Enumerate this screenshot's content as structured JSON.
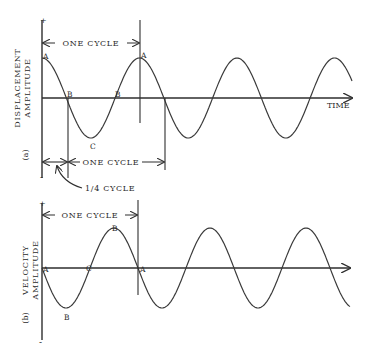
{
  "diagram": {
    "panel_a": {
      "tag": "(a)",
      "ylabel_line1": "DISPLACEMENT",
      "ylabel_line2": "AMPLITUDE",
      "plus": "+",
      "minus": "-",
      "xlabel": "TIME",
      "cycle_top": "ONE CYCLE",
      "cycle_bottom": "ONE CYCLE",
      "quarter_cycle": "1/4 CYCLE",
      "points": {
        "A1": "A",
        "A2": "A",
        "B1": "B",
        "B2": "B",
        "C": "C"
      },
      "waveform": "cosine",
      "cycles_shown": 3.2
    },
    "panel_b": {
      "tag": "(b)",
      "ylabel_line1": "VELOCITY",
      "ylabel_line2": "AMPLITUDE",
      "plus": "+",
      "minus": "-",
      "cycle_top": "ONE CYCLE",
      "points": {
        "A1": "A",
        "A2": "A",
        "B_trough": "B",
        "B_peak": "B",
        "C": "C"
      },
      "waveform": "negative sine",
      "cycles_shown": 3.2
    }
  }
}
